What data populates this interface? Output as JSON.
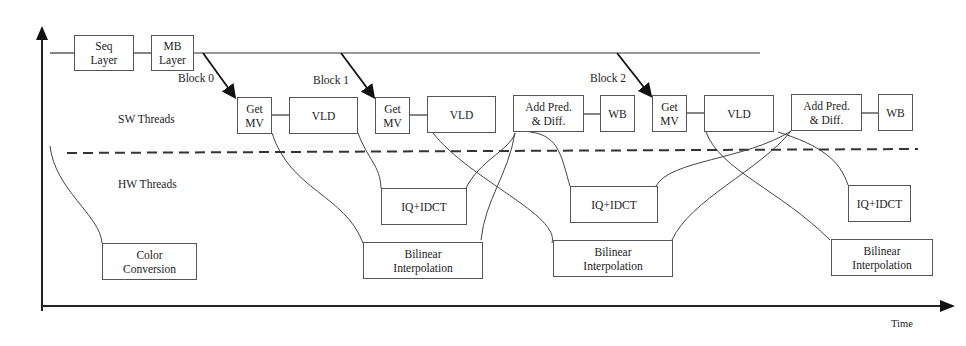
{
  "diagram": {
    "axes": {
      "x_label": "Time"
    },
    "lanes": {
      "sw": "SW Threads",
      "hw": "HW Threads"
    },
    "block_labels": [
      "Block 0",
      "Block 1",
      "Block 2"
    ],
    "top_row": {
      "seq_layer": "Seq\nLayer",
      "mb_layer": "MB\nLayer"
    },
    "sw_boxes": [
      {
        "id": "getmv0",
        "label": "Get\nMV"
      },
      {
        "id": "vld0",
        "label": "VLD"
      },
      {
        "id": "getmv1",
        "label": "Get\nMV"
      },
      {
        "id": "vld1",
        "label": "VLD"
      },
      {
        "id": "addpred1",
        "label": "Add Pred.\n& Diff."
      },
      {
        "id": "wb1",
        "label": "WB"
      },
      {
        "id": "getmv2",
        "label": "Get\nMV"
      },
      {
        "id": "vld2",
        "label": "VLD"
      },
      {
        "id": "addpred2",
        "label": "Add Pred.\n& Diff."
      },
      {
        "id": "wb2",
        "label": "WB"
      }
    ],
    "hw_boxes": [
      {
        "id": "color",
        "label": "Color\nConversion"
      },
      {
        "id": "iq0",
        "label": "IQ+IDCT"
      },
      {
        "id": "bil0",
        "label": "Bilinear\nInterpolation"
      },
      {
        "id": "iq1",
        "label": "IQ+IDCT"
      },
      {
        "id": "bil1",
        "label": "Bilinear\nInterpolation"
      },
      {
        "id": "iq2",
        "label": "IQ+IDCT"
      },
      {
        "id": "bil2",
        "label": "Bilinear\nInterpolation"
      }
    ]
  }
}
